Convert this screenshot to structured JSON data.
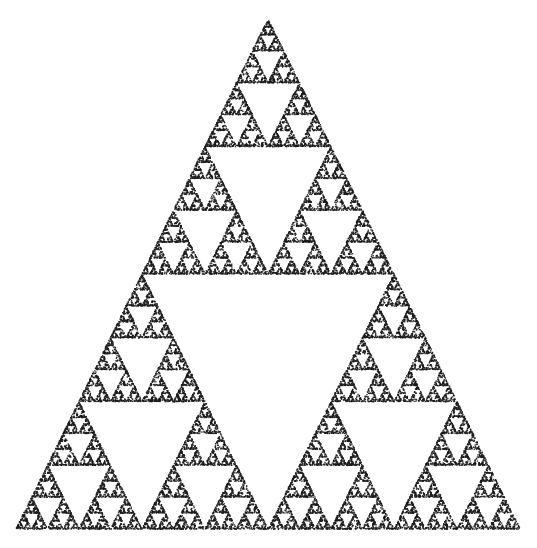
{
  "image": {
    "width": 537,
    "height": 548,
    "background_color": "#ffffff",
    "title": "Sierpinski Triangle",
    "description": "Sierpinski gasket rendered as a dense scatter of small dark dots produced by the chaos game iteration."
  },
  "chart_data": {
    "type": "scatter",
    "subtitle": "",
    "xlabel": "",
    "ylabel": "",
    "xlim": [
      0,
      537
    ],
    "ylim": [
      0,
      548
    ],
    "grid": false,
    "legend": null,
    "axes_visible": false,
    "tick_labels_x": [],
    "tick_labels_y": [],
    "annotations": [],
    "marker": {
      "shape": "square",
      "size_px": 1.35,
      "color": "#1a1a1a",
      "opacity": 0.92
    },
    "point_count": 26000,
    "generator": {
      "algorithm": "chaos-game",
      "ratio": 0.5,
      "iterations": 26000,
      "burn_in": 20,
      "seed": 20250611,
      "jitter_px": 0.55
    },
    "vertices": [
      {
        "name": "apex",
        "x": 268,
        "y": 19
      },
      {
        "name": "bottom-left",
        "x": 16,
        "y": 529
      },
      {
        "name": "bottom-right",
        "x": 520,
        "y": 529
      }
    ],
    "edge_midpoints": [
      {
        "name": "left-mid",
        "x": 142,
        "y": 274
      },
      {
        "name": "right-mid",
        "x": 394,
        "y": 274
      },
      {
        "name": "bottom-mid",
        "x": 268,
        "y": 529
      }
    ],
    "recursion_levels_visible": 5,
    "bounding_box": {
      "x": 16,
      "y": 19,
      "width": 504,
      "height": 510
    }
  }
}
